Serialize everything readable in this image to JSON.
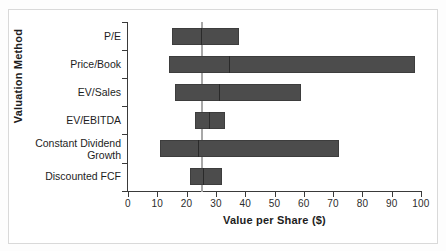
{
  "chart_data": {
    "type": "bar",
    "orientation": "horizontal",
    "title": "",
    "xlabel": "Value per Share ($)",
    "ylabel": "Valuation Method",
    "xlim": [
      0,
      100
    ],
    "xticks": [
      0,
      10,
      20,
      30,
      40,
      50,
      60,
      70,
      80,
      90,
      100
    ],
    "xticklabels": [
      "0",
      "10",
      "20",
      "30",
      "40",
      "50",
      "60",
      "70",
      "80",
      "90",
      "100"
    ],
    "grid": false,
    "legend": null,
    "reference_line": {
      "value": 25,
      "color": "#a8a8a8",
      "orientation": "vertical"
    },
    "bar_color": "#4c4c4c",
    "categories": [
      "P/E",
      "Price/Book",
      "EV/Sales",
      "EV/EBITDA",
      "Constant Dividend Growth",
      "Discounted FCF"
    ],
    "ranges": [
      {
        "category": "P/E",
        "low": 15,
        "high": 38,
        "marker": 25.0
      },
      {
        "category": "Price/Book",
        "low": 14,
        "high": 98,
        "marker": 34.5
      },
      {
        "category": "EV/Sales",
        "low": 16,
        "high": 59,
        "marker": 31.0
      },
      {
        "category": "EV/EBITDA",
        "low": 23,
        "high": 33,
        "marker": 27.5
      },
      {
        "category": "Constant Dividend Growth",
        "low": 11,
        "high": 72,
        "marker": 24.0
      },
      {
        "category": "Discounted FCF",
        "low": 21,
        "high": 32,
        "marker": 25.5
      }
    ]
  },
  "axes": {
    "x_title": "Value per Share ($)",
    "y_title": "Valuation Method",
    "tick_0": "0",
    "tick_10": "10",
    "tick_20": "20",
    "tick_30": "30",
    "tick_40": "40",
    "tick_50": "50",
    "tick_60": "60",
    "tick_70": "70",
    "tick_80": "80",
    "tick_90": "90",
    "tick_100": "100"
  },
  "category_labels": {
    "c0": "P/E",
    "c1": "Price/Book",
    "c2": "EV/Sales",
    "c3a": "Constant Dividend",
    "c3b": "Growth",
    "c4": "EV/EBITDA",
    "c5": "Discounted FCF"
  }
}
